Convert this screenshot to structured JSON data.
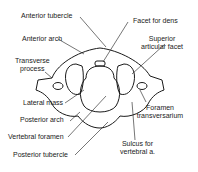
{
  "diagram": {
    "labels": {
      "anterior_tubercle": "Anterior tubercle",
      "anterior_arch": "Anterior arch",
      "transverse_process_1": "Transverse",
      "transverse_process_2": "process",
      "lateral_mass": "Lateral mass",
      "posterior_arch": "Posterior arch",
      "vertebral_foramen": "Vertebral foramen",
      "posterior_tubercle": "Posterior tubercle",
      "facet_for_dens": "Facet for dens",
      "superior_articular_facet_1": "Superior",
      "superior_articular_facet_2": "articular facet",
      "foramen_transversarium_1": "Foramen",
      "foramen_transversarium_2": "transversarium",
      "sulcus_1": "Sulcus for",
      "sulcus_2": "vertebral a."
    }
  }
}
